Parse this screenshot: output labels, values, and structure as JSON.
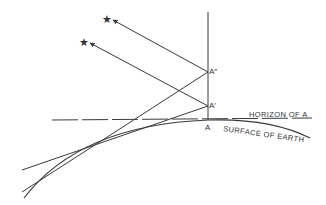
{
  "diagram": {
    "colors": {
      "line": "#3a3a3a",
      "background": "#ffffff"
    },
    "labels": {
      "a_double_prime": "A″",
      "a_prime": "A′",
      "a": "A",
      "horizon": "HORIZON OF A",
      "surface": "SURFACE OF EARTH"
    },
    "icons": {
      "star_upper": "★",
      "star_lower": "★"
    }
  }
}
